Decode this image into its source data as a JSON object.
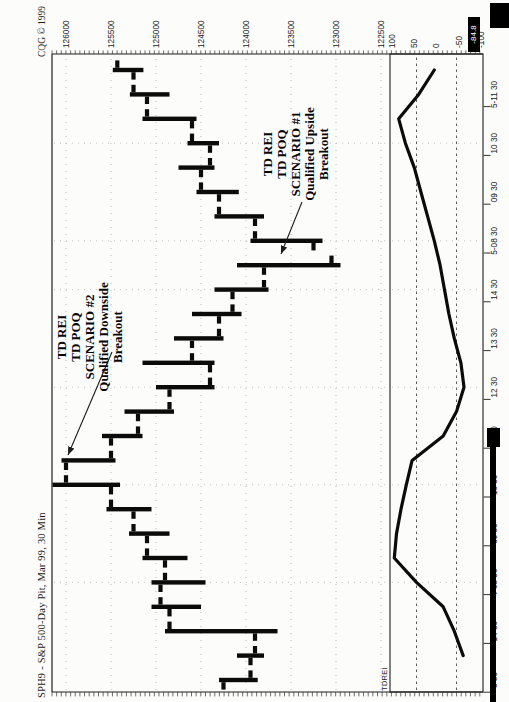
{
  "page": {
    "width": 509,
    "height": 702,
    "paper": "#fcfcfb",
    "ink": "#0b0b0b"
  },
  "header": {
    "title": "SPH9 - S&P 500-Day Pit, Mar 99, 30 Min",
    "copyright": "CQG © 1999"
  },
  "price_axis": {
    "labels": [
      "126000",
      "125500",
      "125000",
      "124500",
      "124000",
      "123500",
      "123000",
      "122500"
    ],
    "max": 126000,
    "min": 122500,
    "step": 500
  },
  "time_axis": {
    "labels": [
      {
        "text": "3 30",
        "bar": 0
      },
      {
        "text": "14 30",
        "bar": 2
      },
      {
        "text": "4-08 30",
        "bar": 4
      },
      {
        "text": "09 30",
        "bar": 6
      },
      {
        "text": "10 30",
        "bar": 8
      },
      {
        "text": "11 30",
        "bar": 10
      },
      {
        "text": "12 30",
        "bar": 12
      },
      {
        "text": "13 30",
        "bar": 14
      },
      {
        "text": "14 30",
        "bar": 16
      },
      {
        "text": "5-08 30",
        "bar": 18
      },
      {
        "text": "09 30",
        "bar": 20
      },
      {
        "text": "10 30",
        "bar": 22
      },
      {
        "text": "5-11 30",
        "bar": 24
      }
    ]
  },
  "indicator_panel": {
    "name": "TDREI",
    "scale_labels": [
      "100",
      "50",
      "0",
      "-50",
      "-100"
    ],
    "scale_values": [
      100,
      50,
      0,
      -50,
      -100
    ],
    "bands": [
      45,
      -45
    ],
    "highlight_label": "-84.8"
  },
  "annotations": [
    {
      "id": "scenario-2",
      "lines": [
        "TD REI",
        "TD POQ",
        "SCENARIO #2",
        "Qualified Downside",
        "Breakout"
      ],
      "box": {
        "left": 299,
        "top": 55,
        "width": 132
      },
      "arrow": {
        "x1": 350,
        "y1": 112,
        "x2": 247,
        "y2": 68
      }
    },
    {
      "id": "scenario-1",
      "lines": [
        "TD REI",
        "TD POQ",
        "SCENARIO #1",
        "Qualified Upside",
        "Breakout"
      ],
      "box": {
        "left": 486,
        "top": 261,
        "width": 124
      },
      "arrow": {
        "x1": 500,
        "y1": 302,
        "x2": 448,
        "y2": 281
      }
    }
  ],
  "chart_data": [
    {
      "type": "bar",
      "subtype": "ohlc",
      "title": "SPH9 S&P 500 Day Pit Mar 99, 30-min bars",
      "ylabel": "price",
      "ylim": [
        122450,
        126200
      ],
      "grid": "dotted",
      "times": [
        "3-13:30",
        "3-14:00",
        "3-14:30",
        "3-15:00",
        "4-08:30",
        "4-09:00",
        "4-09:30",
        "4-10:00",
        "4-10:30",
        "4-11:00",
        "4-11:30",
        "4-12:00",
        "4-12:30",
        "4-13:00",
        "4-13:30",
        "4-14:00",
        "4-14:30",
        "4-15:00",
        "5-08:30",
        "5-09:00",
        "5-09:30",
        "5-10:00",
        "5-10:30",
        "5-11:00",
        "5-11:30",
        "5-12:00"
      ],
      "bars_ohlc": [
        [
          124250,
          124300,
          123870,
          123950
        ],
        [
          123950,
          124100,
          123800,
          123900
        ],
        [
          123900,
          124900,
          123650,
          124850
        ],
        [
          124850,
          125050,
          124500,
          124950
        ],
        [
          124950,
          125050,
          124450,
          124900
        ],
        [
          124900,
          125150,
          124650,
          125100
        ],
        [
          125100,
          125300,
          124850,
          125250
        ],
        [
          125250,
          125550,
          125050,
          125500
        ],
        [
          125500,
          126150,
          125400,
          126000
        ],
        [
          126000,
          126050,
          125450,
          125500
        ],
        [
          125500,
          125600,
          125150,
          125200
        ],
        [
          125200,
          125350,
          124800,
          124850
        ],
        [
          124850,
          125000,
          124350,
          124400
        ],
        [
          124400,
          125150,
          124350,
          124600
        ],
        [
          124600,
          124800,
          124250,
          124300
        ],
        [
          124300,
          124600,
          124050,
          124150
        ],
        [
          124150,
          124350,
          123750,
          123800
        ],
        [
          123800,
          124100,
          122950,
          123050
        ],
        [
          123250,
          123950,
          123150,
          123900
        ],
        [
          123900,
          124350,
          123800,
          124300
        ],
        [
          124300,
          124550,
          124080,
          124500
        ],
        [
          124500,
          124750,
          124350,
          124400
        ],
        [
          124400,
          124650,
          124300,
          124600
        ],
        [
          124600,
          125150,
          124550,
          125100
        ],
        [
          125100,
          125290,
          124850,
          125250
        ],
        [
          125250,
          125480,
          125140,
          125430
        ]
      ]
    },
    {
      "type": "line",
      "title": "TDREI",
      "ylim": [
        -100,
        100
      ],
      "bands": [
        45,
        -45
      ],
      "values": [
        null,
        -60,
        -40,
        -15,
        45,
        95,
        90,
        80,
        68,
        55,
        -15,
        -45,
        -62,
        -55,
        -40,
        -28,
        -18,
        -8,
        5,
        20,
        35,
        50,
        70,
        85,
        40,
        5
      ]
    }
  ]
}
